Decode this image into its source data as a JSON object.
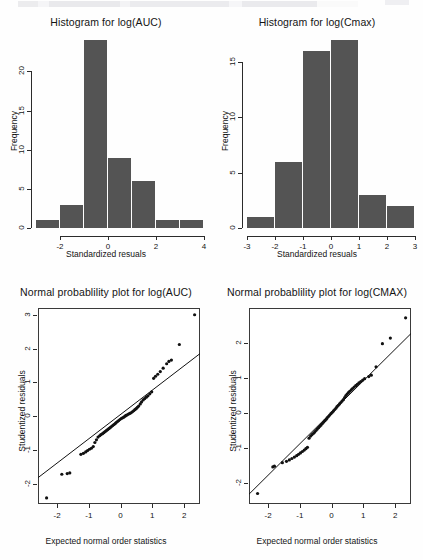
{
  "document": {
    "running_head": "",
    "background_color": "#fefefe",
    "bar_color": "#545454",
    "axis_color": "#2b2b2b"
  },
  "panels": {
    "hist_auc": {
      "title": "Histogram for log(AUC)",
      "xlabel": "Standardized resuals",
      "ylabel": "Frequency"
    },
    "hist_cmax": {
      "title": "Histogram for log(Cmax)",
      "xlabel": "Standardized resuals",
      "ylabel": "Frequency"
    },
    "qq_auc": {
      "title": "Normal probablility plot for log(AUC)",
      "xlabel": "Expected normal order statistics",
      "ylabel": "Studentized residuals"
    },
    "qq_cmax": {
      "title": "Normal probablility plot for log(CMAX)",
      "xlabel": "Expected normal order statistics",
      "ylabel": "Studentized residuals"
    }
  },
  "chart_data": [
    {
      "id": "hist_auc",
      "type": "bar",
      "title": "Histogram for log(AUC)",
      "xlabel": "Standardized resuals",
      "ylabel": "Frequency",
      "bin_edges": [
        -3,
        -2,
        -1,
        0,
        1,
        2,
        3,
        4
      ],
      "categories": [
        "-3 to -2",
        "-2 to -1",
        "-1 to 0",
        "0 to 1",
        "1 to 2",
        "2 to 3",
        "3 to 4"
      ],
      "values": [
        1,
        3,
        24,
        9,
        6,
        1,
        1
      ],
      "xlim": [
        -3,
        4
      ],
      "ylim": [
        0,
        24
      ],
      "xticks": [
        -2,
        0,
        2,
        4
      ],
      "xticklabels": [
        "-2",
        "0",
        "2",
        "4"
      ],
      "yticks": [
        0,
        5,
        10,
        15,
        20
      ],
      "yticklabels": [
        "0",
        "5",
        "10",
        "15",
        "20"
      ],
      "grid": false,
      "legend": false
    },
    {
      "id": "hist_cmax",
      "type": "bar",
      "title": "Histogram for log(Cmax)",
      "xlabel": "Standardized resuals",
      "ylabel": "Frequency",
      "bin_edges": [
        -3,
        -2,
        -1,
        0,
        1,
        2,
        3
      ],
      "categories": [
        "-3 to -2",
        "-2 to -1",
        "-1 to 0",
        "0 to 1",
        "1 to 2",
        "2 to 3"
      ],
      "values": [
        1,
        6,
        16,
        17,
        3,
        2
      ],
      "xlim": [
        -3,
        3
      ],
      "ylim": [
        0,
        17
      ],
      "xticks": [
        -3,
        -2,
        -1,
        0,
        1,
        2,
        3
      ],
      "xticklabels": [
        "-3",
        "-2",
        "-1",
        "0",
        "1",
        "2",
        "3"
      ],
      "yticks": [
        0,
        5,
        10,
        15
      ],
      "yticklabels": [
        "0",
        "5",
        "10",
        "15"
      ],
      "grid": false,
      "legend": false
    },
    {
      "id": "qq_auc",
      "type": "scatter",
      "title": "Normal probablility plot for log(AUC)",
      "xlabel": "Expected normal order statistics",
      "ylabel": "Studentized residuals",
      "xlim": [
        -2.6,
        2.5
      ],
      "ylim": [
        -2.6,
        3.2
      ],
      "xticks": [
        -2,
        -1,
        0,
        1,
        2
      ],
      "xticklabels": [
        "-2",
        "-1",
        "0",
        "1",
        "2"
      ],
      "yticks": [
        -2,
        -1,
        0,
        1,
        2,
        3
      ],
      "yticklabels": [
        "-2",
        "-1",
        "0",
        "1",
        "2",
        "3"
      ],
      "grid": false,
      "legend": false,
      "reference_line": {
        "slope": 0.72,
        "intercept": 0.05,
        "style": "solid"
      },
      "points": [
        [
          -2.33,
          -2.42
        ],
        [
          -1.85,
          -1.72
        ],
        [
          -1.68,
          -1.7
        ],
        [
          -1.6,
          -1.68
        ],
        [
          -1.25,
          -1.13
        ],
        [
          -1.17,
          -1.1
        ],
        [
          -1.1,
          -1.06
        ],
        [
          -1.04,
          -1.02
        ],
        [
          -0.98,
          -0.98
        ],
        [
          -0.92,
          -0.95
        ],
        [
          -0.86,
          -0.9
        ],
        [
          -0.81,
          -0.78
        ],
        [
          -0.76,
          -0.7
        ],
        [
          -0.71,
          -0.62
        ],
        [
          -0.66,
          -0.58
        ],
        [
          -0.62,
          -0.55
        ],
        [
          -0.57,
          -0.52
        ],
        [
          -0.53,
          -0.49
        ],
        [
          -0.49,
          -0.46
        ],
        [
          -0.45,
          -0.43
        ],
        [
          -0.41,
          -0.4
        ],
        [
          -0.37,
          -0.37
        ],
        [
          -0.33,
          -0.34
        ],
        [
          -0.29,
          -0.31
        ],
        [
          -0.25,
          -0.28
        ],
        [
          -0.21,
          -0.25
        ],
        [
          -0.17,
          -0.22
        ],
        [
          -0.14,
          -0.19
        ],
        [
          -0.1,
          -0.16
        ],
        [
          -0.06,
          -0.13
        ],
        [
          -0.02,
          -0.1
        ],
        [
          0.02,
          -0.07
        ],
        [
          0.06,
          -0.05
        ],
        [
          0.1,
          -0.03
        ],
        [
          0.14,
          0.0
        ],
        [
          0.17,
          0.02
        ],
        [
          0.21,
          0.04
        ],
        [
          0.25,
          0.06
        ],
        [
          0.29,
          0.08
        ],
        [
          0.33,
          0.1
        ],
        [
          0.37,
          0.13
        ],
        [
          0.41,
          0.16
        ],
        [
          0.45,
          0.19
        ],
        [
          0.49,
          0.22
        ],
        [
          0.53,
          0.26
        ],
        [
          0.57,
          0.3
        ],
        [
          0.62,
          0.36
        ],
        [
          0.66,
          0.42
        ],
        [
          0.71,
          0.48
        ],
        [
          0.76,
          0.52
        ],
        [
          0.81,
          0.56
        ],
        [
          0.86,
          0.6
        ],
        [
          0.92,
          0.66
        ],
        [
          0.98,
          0.72
        ],
        [
          1.04,
          1.12
        ],
        [
          1.1,
          1.18
        ],
        [
          1.17,
          1.24
        ],
        [
          1.25,
          1.32
        ],
        [
          1.34,
          1.42
        ],
        [
          1.45,
          1.55
        ],
        [
          1.52,
          1.62
        ],
        [
          1.6,
          1.66
        ],
        [
          1.85,
          2.12
        ],
        [
          2.33,
          3.0
        ]
      ]
    },
    {
      "id": "qq_cmax",
      "type": "scatter",
      "title": "Normal probablility plot for log(CMAX)",
      "xlabel": "Expected normal order statistics",
      "ylabel": "Studentized residuals",
      "xlim": [
        -2.6,
        2.5
      ],
      "ylim": [
        -2.6,
        3.0
      ],
      "xticks": [
        -2,
        -1,
        0,
        1,
        2
      ],
      "xticklabels": [
        "-2",
        "-1",
        "0",
        "1",
        "2"
      ],
      "yticks": [
        -2,
        -1,
        0,
        1,
        2
      ],
      "yticklabels": [
        "-2",
        "-1",
        "0",
        "1",
        "2"
      ],
      "grid": false,
      "legend": false,
      "reference_line": {
        "slope": 0.9,
        "intercept": 0.02,
        "style": "solid"
      },
      "points": [
        [
          -2.33,
          -2.3
        ],
        [
          -1.85,
          -1.54
        ],
        [
          -1.8,
          -1.52
        ],
        [
          -1.55,
          -1.42
        ],
        [
          -1.42,
          -1.38
        ],
        [
          -1.33,
          -1.34
        ],
        [
          -1.25,
          -1.3
        ],
        [
          -1.17,
          -1.26
        ],
        [
          -1.1,
          -1.22
        ],
        [
          -1.04,
          -1.18
        ],
        [
          -0.98,
          -1.14
        ],
        [
          -0.92,
          -1.1
        ],
        [
          -0.86,
          -1.06
        ],
        [
          -0.81,
          -1.02
        ],
        [
          -0.76,
          -0.98
        ],
        [
          -0.71,
          -0.72
        ],
        [
          -0.66,
          -0.66
        ],
        [
          -0.62,
          -0.62
        ],
        [
          -0.57,
          -0.58
        ],
        [
          -0.53,
          -0.54
        ],
        [
          -0.49,
          -0.5
        ],
        [
          -0.45,
          -0.46
        ],
        [
          -0.41,
          -0.42
        ],
        [
          -0.37,
          -0.38
        ],
        [
          -0.33,
          -0.34
        ],
        [
          -0.29,
          -0.3
        ],
        [
          -0.25,
          -0.26
        ],
        [
          -0.21,
          -0.22
        ],
        [
          -0.17,
          -0.18
        ],
        [
          -0.14,
          -0.14
        ],
        [
          -0.1,
          -0.1
        ],
        [
          -0.06,
          -0.06
        ],
        [
          -0.02,
          -0.02
        ],
        [
          0.02,
          0.02
        ],
        [
          0.06,
          0.06
        ],
        [
          0.1,
          0.1
        ],
        [
          0.14,
          0.14
        ],
        [
          0.17,
          0.18
        ],
        [
          0.21,
          0.22
        ],
        [
          0.25,
          0.26
        ],
        [
          0.29,
          0.3
        ],
        [
          0.33,
          0.34
        ],
        [
          0.37,
          0.38
        ],
        [
          0.41,
          0.44
        ],
        [
          0.45,
          0.5
        ],
        [
          0.49,
          0.54
        ],
        [
          0.53,
          0.58
        ],
        [
          0.57,
          0.62
        ],
        [
          0.62,
          0.66
        ],
        [
          0.66,
          0.7
        ],
        [
          0.71,
          0.74
        ],
        [
          0.76,
          0.78
        ],
        [
          0.81,
          0.82
        ],
        [
          0.86,
          0.86
        ],
        [
          0.92,
          0.9
        ],
        [
          0.98,
          0.94
        ],
        [
          1.04,
          0.98
        ],
        [
          1.17,
          1.04
        ],
        [
          1.25,
          1.08
        ],
        [
          1.4,
          1.32
        ],
        [
          1.6,
          1.98
        ],
        [
          1.85,
          2.14
        ],
        [
          2.33,
          2.72
        ]
      ]
    }
  ]
}
